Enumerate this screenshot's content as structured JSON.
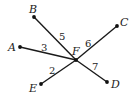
{
  "diagram": {
    "type": "geometry",
    "center": {
      "name": "F",
      "x": 76,
      "y": 60,
      "label_x": 72,
      "label_y": 55
    },
    "points": [
      {
        "name": "A",
        "x": 20,
        "y": 47,
        "label_x": 8,
        "label_y": 51
      },
      {
        "name": "B",
        "x": 34,
        "y": 17,
        "label_x": 29,
        "label_y": 13
      },
      {
        "name": "C",
        "x": 117,
        "y": 26,
        "label_x": 120,
        "label_y": 26
      },
      {
        "name": "D",
        "x": 107,
        "y": 82,
        "label_x": 111,
        "label_y": 88
      },
      {
        "name": "E",
        "x": 41,
        "y": 84,
        "label_x": 29,
        "label_y": 92
      }
    ],
    "segments": [
      {
        "from": "F",
        "to": "A",
        "length_label": "3",
        "label_x": 41,
        "label_y": 51
      },
      {
        "from": "F",
        "to": "B",
        "length_label": "5",
        "label_x": 59,
        "label_y": 40
      },
      {
        "from": "F",
        "to": "C",
        "length_label": "6",
        "label_x": 85,
        "label_y": 47
      },
      {
        "from": "F",
        "to": "D",
        "length_label": "7",
        "label_x": 92,
        "label_y": 70
      },
      {
        "from": "F",
        "to": "E",
        "length_label": "2",
        "label_x": 49,
        "label_y": 74
      }
    ],
    "colors": {
      "line": "#1a1a1a",
      "text": "#222222",
      "background": "#ffffff"
    }
  }
}
